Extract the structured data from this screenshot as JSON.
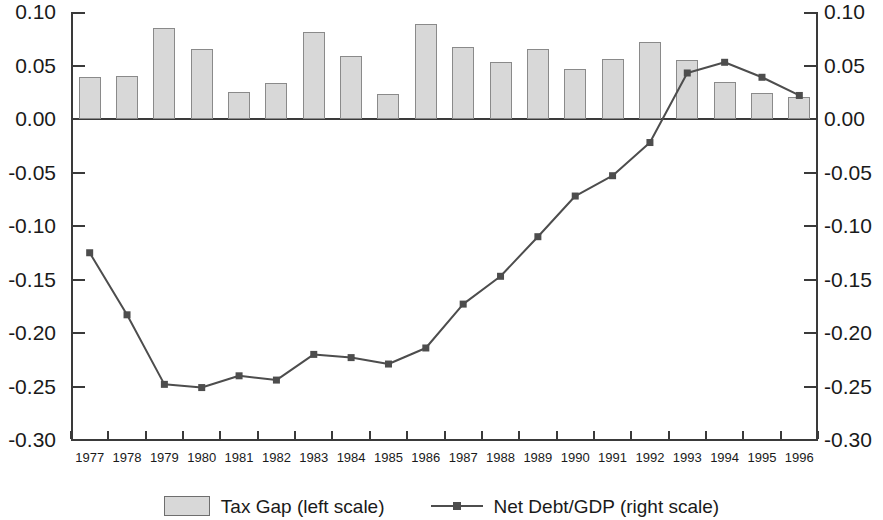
{
  "chart_data": {
    "type": "bar",
    "title": "",
    "xlabel": "",
    "ylabel": "",
    "ylim": [
      -0.3,
      0.1
    ],
    "y2lim": [
      -0.3,
      0.1
    ],
    "grid": false,
    "legend_position": "bottom-center",
    "categories": [
      "1977",
      "1978",
      "1979",
      "1980",
      "1981",
      "1982",
      "1983",
      "1984",
      "1985",
      "1986",
      "1987",
      "1988",
      "1989",
      "1990",
      "1991",
      "1992",
      "1993",
      "1994",
      "1995",
      "1996"
    ],
    "ytick_labels": [
      "0.10",
      "0.05",
      "0.00",
      "-0.05",
      "-0.10",
      "-0.15",
      "-0.20",
      "-0.25",
      "-0.30"
    ],
    "ytick_values": [
      0.1,
      0.05,
      0.0,
      -0.05,
      -0.1,
      -0.15,
      -0.2,
      -0.25,
      -0.3
    ],
    "y2tick_labels": [
      "0.10",
      "0.05",
      "0.00",
      "-0.05",
      "-0.10",
      "-0.15",
      "-0.20",
      "-0.25",
      "-0.30"
    ],
    "y2tick_values": [
      0.1,
      0.05,
      0.0,
      -0.05,
      -0.1,
      -0.15,
      -0.2,
      -0.25,
      -0.3
    ],
    "series": [
      {
        "name": "Tax Gap (left scale)",
        "type": "bar",
        "axis": "left",
        "color": "#d8d8d8",
        "edge_color": "#8a8a8a",
        "values": [
          0.039,
          0.04,
          0.085,
          0.065,
          0.025,
          0.034,
          0.081,
          0.059,
          0.023,
          0.089,
          0.067,
          0.053,
          0.065,
          0.047,
          0.056,
          0.072,
          0.055,
          0.035,
          0.024,
          0.021
        ]
      },
      {
        "name": "Net Debt/GDP (right scale)",
        "type": "line",
        "axis": "right",
        "color": "#4d4d4d",
        "marker": "square",
        "values": [
          -0.125,
          -0.183,
          -0.248,
          -0.251,
          -0.24,
          -0.244,
          -0.22,
          -0.223,
          -0.229,
          -0.214,
          -0.173,
          -0.147,
          -0.11,
          -0.072,
          -0.053,
          -0.022,
          0.043,
          0.053,
          0.039,
          0.022
        ]
      }
    ]
  },
  "legend": {
    "entries": [
      {
        "label": "Tax Gap (left scale)",
        "marker": "swatch"
      },
      {
        "label": "Net Debt/GDP (right scale)",
        "marker": "line-with-square"
      }
    ]
  }
}
